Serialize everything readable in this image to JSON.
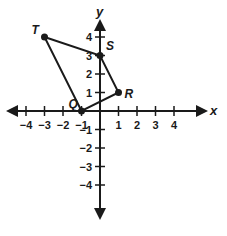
{
  "diagram": {
    "type": "coordinate-plane-polygon",
    "axes": {
      "x_label": "x",
      "y_label": "y",
      "x_ticks": [
        -4,
        -3,
        -2,
        -1,
        1,
        2,
        3,
        4
      ],
      "y_ticks": [
        4,
        3,
        2,
        1,
        -1,
        -2,
        -3,
        -4
      ],
      "x_tick_labels": [
        "−4",
        "−3",
        "−2",
        "−1",
        "1",
        "2",
        "3",
        "4"
      ],
      "y_tick_labels": [
        "4",
        "3",
        "2",
        "1",
        "−1",
        "−2",
        "−3",
        "−4"
      ]
    },
    "points": [
      {
        "name": "T",
        "x": -3,
        "y": 4
      },
      {
        "name": "S",
        "x": 0,
        "y": 3
      },
      {
        "name": "R",
        "x": 1,
        "y": 1
      },
      {
        "name": "Q",
        "x": -1,
        "y": 0
      }
    ],
    "polygon_order": [
      "T",
      "S",
      "R",
      "Q"
    ],
    "colors": {
      "ink": "#1a1a1a",
      "background": "#ffffff"
    }
  }
}
